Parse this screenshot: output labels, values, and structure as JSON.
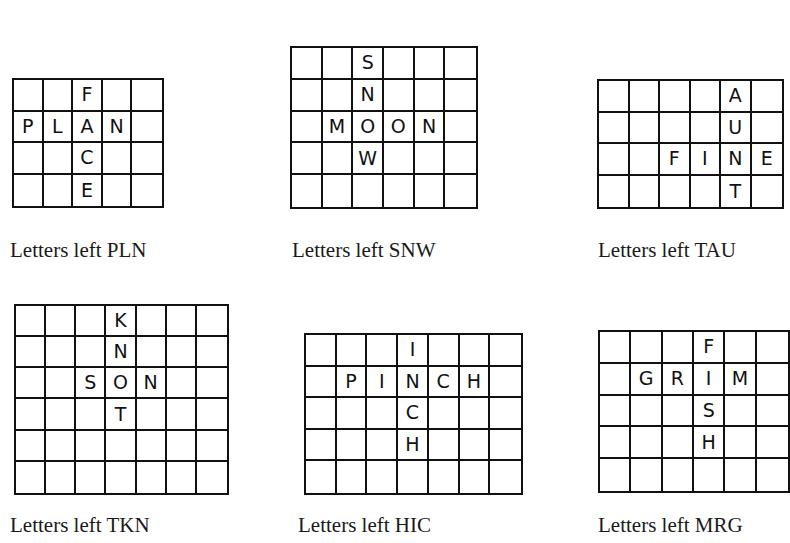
{
  "puzzles": [
    {
      "id": "plan-face",
      "grid": {
        "left": 12,
        "top": 78,
        "width": 152,
        "height": 130,
        "cols": 5,
        "rows": 4
      },
      "cells": [
        [
          "",
          "",
          "F",
          "",
          ""
        ],
        [
          "P",
          "L",
          "A",
          "N",
          ""
        ],
        [
          "",
          "",
          "C",
          "",
          ""
        ],
        [
          "",
          "",
          "E",
          "",
          ""
        ]
      ],
      "caption": {
        "text": "Letters left PLN",
        "left": 10,
        "top": 238
      }
    },
    {
      "id": "moon-snow",
      "grid": {
        "left": 290,
        "top": 46,
        "width": 188,
        "height": 163,
        "cols": 6,
        "rows": 5
      },
      "cells": [
        [
          "",
          "",
          "S",
          "",
          "",
          ""
        ],
        [
          "",
          "",
          "N",
          "",
          "",
          ""
        ],
        [
          "",
          "M",
          "O",
          "O",
          "N",
          ""
        ],
        [
          "",
          "",
          "W",
          "",
          "",
          ""
        ],
        [
          "",
          "",
          "",
          "",
          "",
          ""
        ]
      ],
      "caption": {
        "text": "Letters left SNW",
        "left": 292,
        "top": 238
      }
    },
    {
      "id": "fine-aunt",
      "grid": {
        "left": 597,
        "top": 79,
        "width": 187,
        "height": 130,
        "cols": 6,
        "rows": 4
      },
      "cells": [
        [
          "",
          "",
          "",
          "",
          "A",
          ""
        ],
        [
          "",
          "",
          "",
          "",
          "U",
          ""
        ],
        [
          "",
          "",
          "F",
          "I",
          "N",
          "E"
        ],
        [
          "",
          "",
          "",
          "",
          "T",
          ""
        ]
      ],
      "caption": {
        "text": "Letters left TAU",
        "left": 598,
        "top": 238
      }
    },
    {
      "id": "son-knot",
      "grid": {
        "left": 14,
        "top": 304,
        "width": 215,
        "height": 191,
        "cols": 7,
        "rows": 6
      },
      "cells": [
        [
          "",
          "",
          "",
          "K",
          "",
          "",
          ""
        ],
        [
          "",
          "",
          "",
          "N",
          "",
          "",
          ""
        ],
        [
          "",
          "",
          "S",
          "O",
          "N",
          "",
          ""
        ],
        [
          "",
          "",
          "",
          "T",
          "",
          "",
          ""
        ],
        [
          "",
          "",
          "",
          "",
          "",
          "",
          ""
        ],
        [
          "",
          "",
          "",
          "",
          "",
          "",
          ""
        ]
      ],
      "caption": {
        "text": "Letters left TKN",
        "left": 10,
        "top": 513
      }
    },
    {
      "id": "pinch-inch",
      "grid": {
        "left": 304,
        "top": 333,
        "width": 219,
        "height": 162,
        "cols": 7,
        "rows": 5
      },
      "cells": [
        [
          "",
          "",
          "",
          "I",
          "",
          "",
          ""
        ],
        [
          "",
          "P",
          "I",
          "N",
          "C",
          "H",
          ""
        ],
        [
          "",
          "",
          "",
          "C",
          "",
          "",
          ""
        ],
        [
          "",
          "",
          "",
          "H",
          "",
          "",
          ""
        ],
        [
          "",
          "",
          "",
          "",
          "",
          "",
          ""
        ]
      ],
      "caption": {
        "text": "Letters left HIC",
        "left": 298,
        "top": 513
      }
    },
    {
      "id": "grim-fish",
      "grid": {
        "left": 598,
        "top": 330,
        "width": 192,
        "height": 163,
        "cols": 6,
        "rows": 5
      },
      "cells": [
        [
          "",
          "",
          "",
          "F",
          "",
          ""
        ],
        [
          "",
          "G",
          "R",
          "I",
          "M",
          ""
        ],
        [
          "",
          "",
          "",
          "S",
          "",
          ""
        ],
        [
          "",
          "",
          "",
          "H",
          "",
          ""
        ],
        [
          "",
          "",
          "",
          "",
          "",
          ""
        ]
      ],
      "caption": {
        "text": "Letters left MRG",
        "left": 598,
        "top": 513
      }
    }
  ]
}
